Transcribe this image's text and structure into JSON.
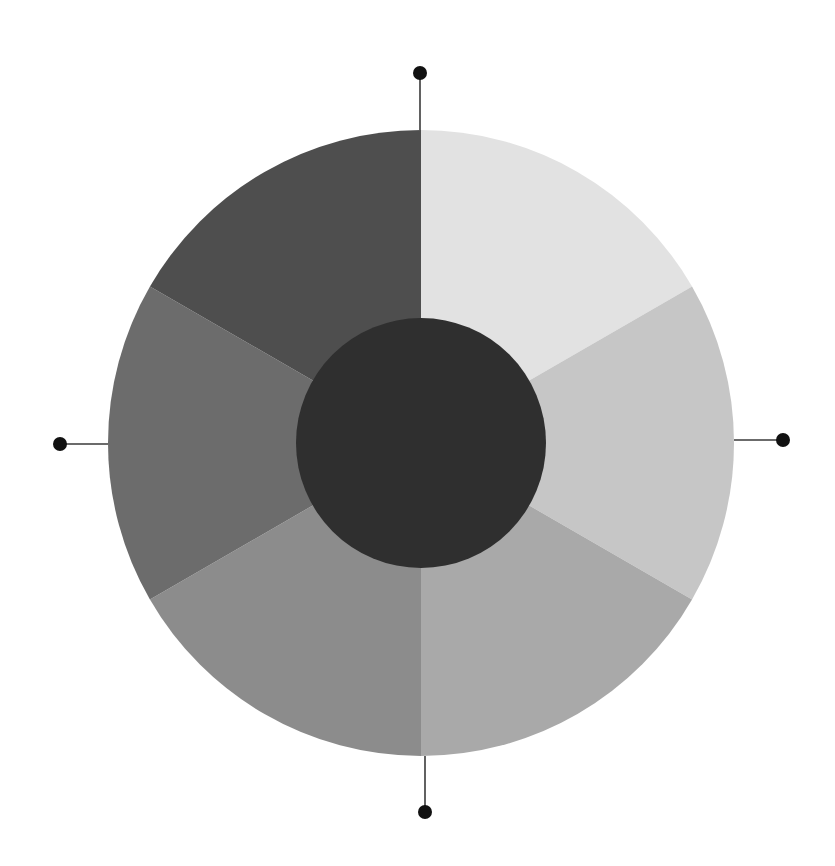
{
  "diagram": {
    "type": "tonal-color-wheel",
    "center": {
      "x": 421,
      "y": 443
    },
    "outer_radius": 313,
    "inner_radius": 125,
    "segments": [
      {
        "id": "segment-1",
        "start_deg": 0,
        "end_deg": 60,
        "color": "#e2e2e2",
        "tone": "lightest"
      },
      {
        "id": "segment-2",
        "start_deg": 60,
        "end_deg": 120,
        "color": "#c6c6c6",
        "tone": "light"
      },
      {
        "id": "segment-3",
        "start_deg": 120,
        "end_deg": 180,
        "color": "#a9a9a9",
        "tone": "light-medium"
      },
      {
        "id": "segment-4",
        "start_deg": 180,
        "end_deg": 240,
        "color": "#8c8c8c",
        "tone": "medium"
      },
      {
        "id": "segment-5",
        "start_deg": 240,
        "end_deg": 300,
        "color": "#6c6c6c",
        "tone": "medium-dark"
      },
      {
        "id": "segment-6",
        "start_deg": 300,
        "end_deg": 360,
        "color": "#4e4e4e",
        "tone": "dark"
      }
    ],
    "center_disk": {
      "color": "#2f2f2f",
      "tone": "darkest"
    },
    "connectors": [
      {
        "id": "connector-top",
        "line": {
          "x1": 420,
          "y1": 130,
          "x2": 420,
          "y2": 73
        },
        "dot": {
          "cx": 420,
          "cy": 73,
          "r": 7
        }
      },
      {
        "id": "connector-right",
        "line": {
          "x1": 734,
          "y1": 440,
          "x2": 783,
          "y2": 440
        },
        "dot": {
          "cx": 783,
          "cy": 440,
          "r": 7
        }
      },
      {
        "id": "connector-bottom",
        "line": {
          "x1": 425,
          "y1": 756,
          "x2": 425,
          "y2": 812
        },
        "dot": {
          "cx": 425,
          "cy": 812,
          "r": 7
        }
      },
      {
        "id": "connector-left",
        "line": {
          "x1": 60,
          "y1": 444,
          "x2": 108,
          "y2": 444
        },
        "dot": {
          "cx": 60,
          "cy": 444,
          "r": 7
        }
      }
    ]
  }
}
